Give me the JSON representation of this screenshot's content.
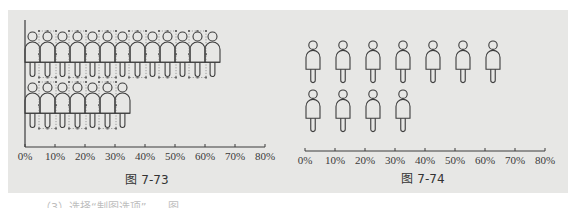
{
  "chart_data": [
    {
      "type": "bar",
      "subtype": "pictogram-stacked",
      "title": "图 7-73",
      "orientation": "horizontal",
      "categories": [
        "Row 1",
        "Row 2"
      ],
      "values": [
        65,
        35
      ],
      "icon_counts": [
        13,
        7
      ],
      "xlabel": "",
      "ylabel": "",
      "xlim": [
        0,
        80
      ],
      "xticks": [
        "0%",
        "10%",
        "20%",
        "30%",
        "40%",
        "50%",
        "60%",
        "70%",
        "80%"
      ],
      "grid": false,
      "legend": null,
      "note": "Figures overlap side-by-side; alternating figures shown with dotted selection handles"
    },
    {
      "type": "bar",
      "subtype": "pictogram-spaced",
      "title": "图 7-74",
      "orientation": "horizontal",
      "categories": [
        "Row 1",
        "Row 2"
      ],
      "values": [
        70,
        40
      ],
      "icon_counts": [
        7,
        4
      ],
      "xlabel": "",
      "ylabel": "",
      "xlim": [
        0,
        80
      ],
      "xticks": [
        "0%",
        "10%",
        "20%",
        "30%",
        "40%",
        "50%",
        "60%",
        "70%",
        "80%"
      ],
      "grid": false,
      "legend": null,
      "note": "One person icon per 10% interval"
    }
  ],
  "figures": {
    "left": {
      "caption": "图 7-73"
    },
    "right": {
      "caption": "图 7-74"
    }
  },
  "ticks": [
    "0%",
    "10%",
    "20%",
    "30%",
    "40%",
    "50%",
    "60%",
    "70%",
    "80%"
  ],
  "colors": {
    "panel_bg": "#e7e7e5",
    "stroke": "#3c3c3c",
    "handle": "#6a6a6a"
  },
  "below_text": "（3）选择“制图选项”……图"
}
